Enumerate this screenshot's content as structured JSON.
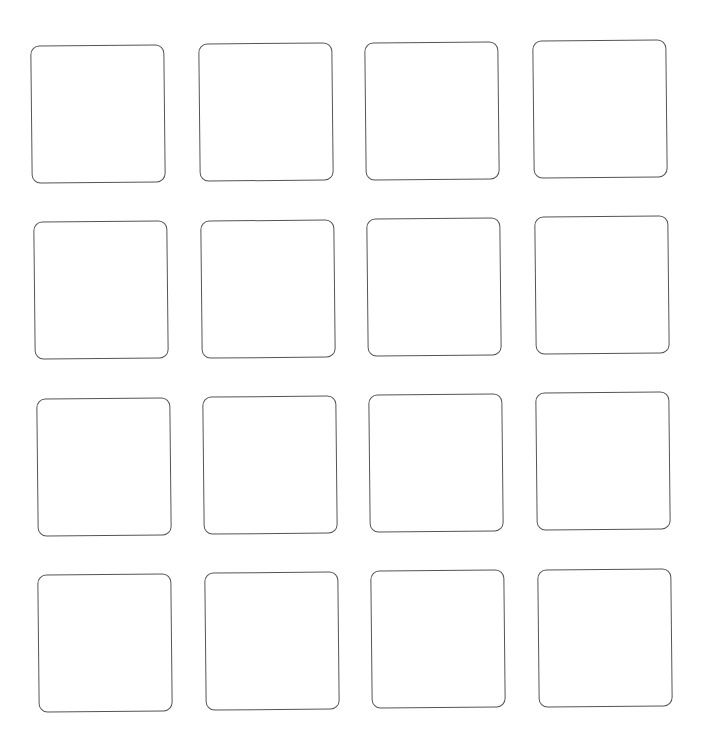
{
  "grid": {
    "rows": 4,
    "columns": 4,
    "stroke_color": "#555555",
    "fill_color": "#ffffff",
    "tiles": [
      {
        "row": 1,
        "col": 1,
        "x": 31,
        "y": 45,
        "label": ""
      },
      {
        "row": 1,
        "col": 2,
        "x": 199,
        "y": 43,
        "label": ""
      },
      {
        "row": 1,
        "col": 3,
        "x": 365,
        "y": 42,
        "label": ""
      },
      {
        "row": 1,
        "col": 4,
        "x": 533,
        "y": 40,
        "label": ""
      },
      {
        "row": 2,
        "col": 1,
        "x": 34,
        "y": 221,
        "label": ""
      },
      {
        "row": 2,
        "col": 2,
        "x": 201,
        "y": 220,
        "label": ""
      },
      {
        "row": 2,
        "col": 3,
        "x": 367,
        "y": 218,
        "label": ""
      },
      {
        "row": 2,
        "col": 4,
        "x": 535,
        "y": 216,
        "label": ""
      },
      {
        "row": 3,
        "col": 1,
        "x": 37,
        "y": 398,
        "label": ""
      },
      {
        "row": 3,
        "col": 2,
        "x": 203,
        "y": 396,
        "label": ""
      },
      {
        "row": 3,
        "col": 3,
        "x": 369,
        "y": 394,
        "label": ""
      },
      {
        "row": 3,
        "col": 4,
        "x": 536,
        "y": 392,
        "label": ""
      },
      {
        "row": 4,
        "col": 1,
        "x": 38,
        "y": 574,
        "label": ""
      },
      {
        "row": 4,
        "col": 2,
        "x": 205,
        "y": 572,
        "label": ""
      },
      {
        "row": 4,
        "col": 3,
        "x": 371,
        "y": 570,
        "label": ""
      },
      {
        "row": 4,
        "col": 4,
        "x": 538,
        "y": 569,
        "label": ""
      }
    ]
  }
}
